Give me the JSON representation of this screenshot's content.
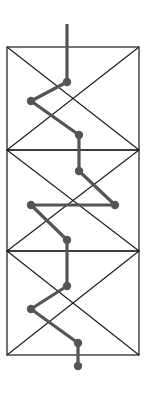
{
  "diagram": {
    "title": "",
    "width": 147,
    "height": 393,
    "colors": {
      "background": "#ffffff",
      "frame": "#1a1a1a",
      "path": "#555555",
      "node": "#555555"
    },
    "frame": {
      "x": 7,
      "y": 47,
      "width": 132,
      "height": 308,
      "dividers_y": [
        150,
        251
      ],
      "panels": [
        {
          "y0": 47,
          "y1": 150
        },
        {
          "y0": 150,
          "y1": 251
        },
        {
          "y0": 251,
          "y1": 355
        }
      ]
    },
    "path": {
      "stroke_width": 3.2,
      "node_radius": 4.2,
      "start": [
        67,
        24
      ],
      "points": [
        [
          67,
          82
        ],
        [
          31,
          101
        ],
        [
          79,
          135
        ],
        [
          79,
          171
        ],
        [
          115,
          205
        ],
        [
          31,
          205
        ],
        [
          67,
          240
        ],
        [
          67,
          286
        ],
        [
          31,
          309
        ],
        [
          78,
          343
        ],
        [
          78,
          366
        ]
      ]
    }
  }
}
